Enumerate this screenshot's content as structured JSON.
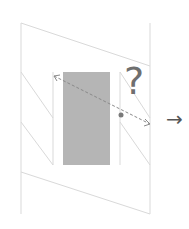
{
  "diagram": {
    "question_mark": "?",
    "next_arrow": "→",
    "colors": {
      "frame_line": "#d9d9d9",
      "rectangle_fill": "#b5b5b5",
      "dashed_arrow": "#8a8a8a",
      "dot": "#7a7a7a",
      "question_mark": "#6f6f6f",
      "next_arrow": "#555555"
    }
  }
}
